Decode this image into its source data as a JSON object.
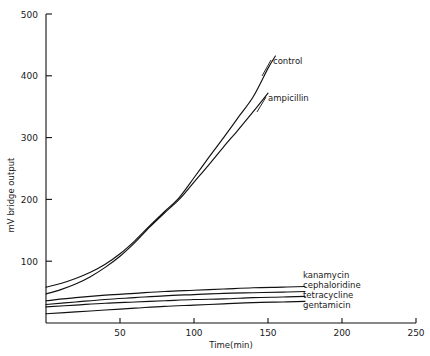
{
  "chart_data": {
    "type": "line",
    "title": "",
    "xlabel": "Time(min)",
    "ylabel": "mV bridge output",
    "xlim": [
      0,
      250
    ],
    "ylim": [
      0,
      500
    ],
    "xticks": [
      50,
      100,
      150,
      200,
      250
    ],
    "yticks": [
      100,
      200,
      300,
      400,
      500
    ],
    "grid": false,
    "legend_position": "inline-right-of-curve-ends",
    "series": [
      {
        "name": "control",
        "label": "control",
        "x": [
          0,
          10,
          20,
          30,
          40,
          50,
          60,
          70,
          80,
          90,
          100,
          110,
          120,
          130,
          140,
          150,
          155
        ],
        "y": [
          58,
          64,
          72,
          82,
          95,
          112,
          133,
          157,
          180,
          203,
          235,
          268,
          300,
          333,
          366,
          412,
          432
        ]
      },
      {
        "name": "ampicillin",
        "label": "ampicillin",
        "x": [
          0,
          10,
          20,
          30,
          40,
          50,
          60,
          70,
          80,
          90,
          100,
          110,
          120,
          130,
          140,
          150
        ],
        "y": [
          47,
          54,
          63,
          75,
          90,
          108,
          130,
          155,
          178,
          200,
          228,
          256,
          285,
          313,
          342,
          372
        ]
      },
      {
        "name": "kanamycin",
        "label": "kanamycin",
        "x": [
          0,
          20,
          40,
          60,
          80,
          100,
          120,
          140,
          160,
          175
        ],
        "y": [
          36,
          41,
          45,
          48,
          51,
          53,
          55,
          57,
          58,
          59
        ]
      },
      {
        "name": "cephaloridine",
        "label": "cephaloridine",
        "x": [
          0,
          20,
          40,
          60,
          80,
          100,
          120,
          140,
          160,
          175
        ],
        "y": [
          30,
          34,
          38,
          41,
          44,
          46,
          48,
          49,
          50,
          51
        ]
      },
      {
        "name": "tetracycline",
        "label": "tetracycline",
        "x": [
          0,
          20,
          40,
          60,
          80,
          100,
          120,
          140,
          160,
          175
        ],
        "y": [
          26,
          29,
          32,
          34,
          36,
          38,
          39,
          41,
          42,
          43
        ]
      },
      {
        "name": "gentamicin",
        "label": "gentamicin",
        "x": [
          0,
          20,
          40,
          60,
          80,
          100,
          120,
          140,
          160,
          175
        ],
        "y": [
          15,
          18,
          21,
          24,
          27,
          29,
          31,
          33,
          34,
          35
        ]
      }
    ]
  },
  "axes": {
    "y_title": "mV bridge output",
    "x_title": "Time(min)",
    "y_tick_labels": [
      "100",
      "200",
      "300",
      "400",
      "500"
    ],
    "x_tick_labels": [
      "50",
      "100",
      "150",
      "200",
      "250"
    ]
  },
  "colors": {
    "ink": "#111111",
    "background": "#ffffff"
  }
}
